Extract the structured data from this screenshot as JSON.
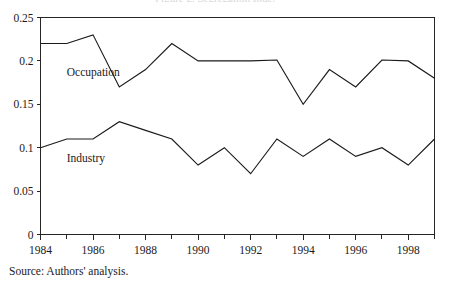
{
  "figure": {
    "title_remnant": "Figure 2. Segregation Indexes",
    "source_note": "Source: Authors' analysis."
  },
  "chart_data": {
    "type": "line",
    "title": "",
    "xlabel": "",
    "ylabel": "",
    "x": [
      1984,
      1985,
      1986,
      1987,
      1988,
      1989,
      1990,
      1991,
      1992,
      1993,
      1994,
      1995,
      1996,
      1997,
      1998,
      1999
    ],
    "xlim": [
      1984,
      1999
    ],
    "ylim": [
      0,
      0.25
    ],
    "ytick_labels": [
      "0.25",
      "0.2",
      "0.15",
      "0.1",
      "0.05",
      "0"
    ],
    "ytick_values": [
      0.25,
      0.2,
      0.15,
      0.1,
      0.05,
      0
    ],
    "xtick_labels": [
      "1984",
      "1986",
      "1988",
      "1990",
      "1992",
      "1994",
      "1996",
      "1998"
    ],
    "xtick_values": [
      1984,
      1986,
      1988,
      1990,
      1992,
      1994,
      1996,
      1998
    ],
    "xminor_values": [
      1985,
      1987,
      1989,
      1991,
      1993,
      1995,
      1997,
      1999
    ],
    "grid": false,
    "legend": "inline-labels",
    "series": [
      {
        "name": "Occupation",
        "label_x": 1985.0,
        "label_y": 0.1875,
        "color": "#1a1a1a",
        "values": [
          0.22,
          0.22,
          0.23,
          0.17,
          0.19,
          0.22,
          0.2,
          0.2,
          0.2,
          0.201,
          0.15,
          0.19,
          0.17,
          0.201,
          0.2,
          0.18
        ]
      },
      {
        "name": "Industry",
        "label_x": 1985.0,
        "label_y": 0.0885,
        "color": "#1a1a1a",
        "values": [
          0.1,
          0.11,
          0.11,
          0.13,
          0.12,
          0.11,
          0.08,
          0.1,
          0.07,
          0.11,
          0.09,
          0.11,
          0.09,
          0.1,
          0.08,
          0.11
        ]
      }
    ]
  }
}
